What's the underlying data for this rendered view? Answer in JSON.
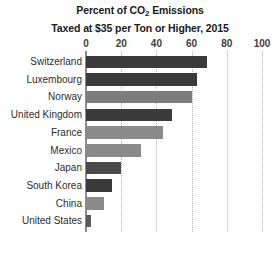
{
  "chart_data": {
    "type": "bar",
    "orientation": "horizontal",
    "title": "Percent of CO2 Emissions Taxed at $35 per Ton or Higher, 2015",
    "title_lines": [
      {
        "pre": "Percent of CO",
        "sub": "2",
        "post": " Emissions"
      },
      {
        "pre": "Taxed at $35 per Ton or Higher, 2015",
        "sub": "",
        "post": ""
      }
    ],
    "categories": [
      "Switzerland",
      "Luxembourg",
      "Norway",
      "United Kingdom",
      "France",
      "Mexico",
      "Japan",
      "South Korea",
      "China",
      "United States"
    ],
    "values": [
      69,
      63,
      60,
      49,
      44,
      31,
      20,
      15,
      10,
      3
    ],
    "bar_colors": [
      "#3a3a3a",
      "#3a3a3a",
      "#7d7d7d",
      "#3a3a3a",
      "#8a8a8a",
      "#8a8a8a",
      "#4a4a4a",
      "#3a3a3a",
      "#8a8a8a",
      "#5a5a5a"
    ],
    "xlabel": "",
    "ylabel": "",
    "xlim": [
      0,
      100
    ],
    "xticks": [
      0,
      20,
      40,
      60,
      80,
      100
    ],
    "xtick_labels": [
      "0",
      "20",
      "40",
      "60",
      "80",
      "100"
    ],
    "grid": true,
    "gridline_color": "#b5b5b5",
    "axis_color": "#8c8c8c",
    "legend": null,
    "background": "#ffffff"
  }
}
